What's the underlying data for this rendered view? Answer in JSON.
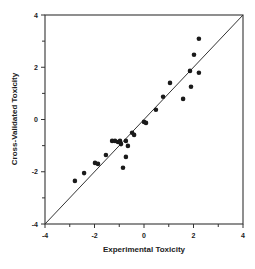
{
  "chart_data": {
    "type": "scatter",
    "title": "",
    "xlabel": "Experimental Toxicity",
    "ylabel": "Cross-Validated Toxicity",
    "xlim": [
      -4,
      4
    ],
    "ylim": [
      -4,
      4
    ],
    "x_ticks": [
      -4,
      -2,
      0,
      2,
      4
    ],
    "y_ticks": [
      -4,
      -2,
      0,
      2,
      4
    ],
    "minor_ticks_every": 1,
    "grid": false,
    "legend": null,
    "reference_line": {
      "type": "identity",
      "from": [
        -4,
        -4
      ],
      "to": [
        4,
        4
      ]
    },
    "series": [
      {
        "name": "compounds",
        "marker": "filled-circle",
        "color": "#1a1a1a",
        "points": [
          [
            -2.79,
            -2.35
          ],
          [
            -2.42,
            -2.05
          ],
          [
            -1.98,
            -1.66
          ],
          [
            -1.86,
            -1.7
          ],
          [
            -1.54,
            -1.36
          ],
          [
            -1.29,
            -0.82
          ],
          [
            -1.17,
            -0.82
          ],
          [
            -1.05,
            -0.86
          ],
          [
            -0.97,
            -0.82
          ],
          [
            -0.93,
            -0.94
          ],
          [
            -0.73,
            -0.82
          ],
          [
            -0.65,
            -1.01
          ],
          [
            -0.73,
            -1.43
          ],
          [
            -0.85,
            -1.85
          ],
          [
            -0.48,
            -0.51
          ],
          [
            -0.4,
            -0.59
          ],
          [
            0.0,
            -0.09
          ],
          [
            0.08,
            -0.13
          ],
          [
            0.48,
            0.37
          ],
          [
            0.77,
            0.87
          ],
          [
            1.05,
            1.4
          ],
          [
            1.58,
            0.79
          ],
          [
            1.9,
            1.25
          ],
          [
            1.86,
            1.86
          ],
          [
            2.22,
            1.79
          ],
          [
            2.02,
            2.48
          ],
          [
            2.22,
            3.09
          ]
        ]
      }
    ]
  },
  "colors": {
    "axis": "#333333",
    "marker": "#1a1a1a",
    "background": "#ffffff"
  }
}
